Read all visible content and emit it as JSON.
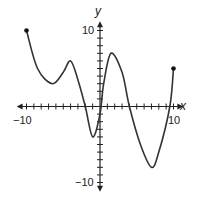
{
  "chart_data": {
    "type": "line",
    "title": "",
    "xlabel": "x",
    "ylabel": "y",
    "xlim": [
      -10,
      10
    ],
    "ylim": [
      -10,
      10
    ],
    "x_tick_step": 1,
    "y_tick_step": 1,
    "x_tick_labels": [
      "-10",
      "10"
    ],
    "y_tick_labels": [
      "10",
      "-10"
    ],
    "grid": false,
    "legend": null,
    "series": [
      {
        "name": "f(x)",
        "color": "#333333",
        "endpoints": "closed",
        "x": [
          -10,
          -8.5,
          -6.5,
          -5,
          -4,
          -3,
          -2,
          -1,
          0,
          0.5,
          1.5,
          3,
          4,
          5.5,
          7,
          8,
          9.5,
          10
        ],
        "y": [
          10,
          5,
          3,
          4.5,
          6,
          3.5,
          0,
          -4,
          -1,
          3,
          7,
          4.5,
          0,
          -5,
          -8,
          -6,
          0,
          5
        ]
      }
    ]
  },
  "labels": {
    "x_axis_name": "x",
    "y_axis_name": "y",
    "x_min_label": "−10",
    "x_max_label": "10",
    "y_max_label": "10",
    "y_min_label": "−10"
  },
  "style": {
    "axis_color": "#222222",
    "curve_color": "#333333"
  }
}
